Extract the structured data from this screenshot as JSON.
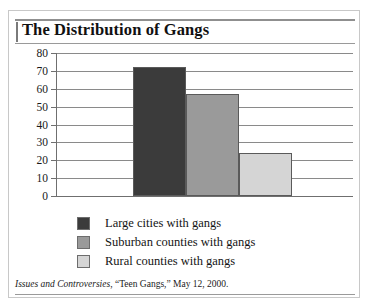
{
  "figure": {
    "title": "The Distribution of Gangs",
    "source_italic": "Issues and Controversies",
    "source_rest": ", “Teen Gangs,” May 12, 2000."
  },
  "chart_data": {
    "type": "bar",
    "title": "The Distribution of Gangs",
    "xlabel": "",
    "ylabel": "",
    "ylim": [
      0,
      80
    ],
    "ytick_values": [
      80,
      70,
      60,
      50,
      40,
      30,
      20,
      10,
      0
    ],
    "ytick_labels": [
      "80",
      "70",
      "60",
      "50",
      "40",
      "30",
      "20",
      "10",
      "0"
    ],
    "grid": true,
    "grid_axis": "y",
    "legend_position": "bottom",
    "categories": [
      "Large cities with gangs",
      "Suburban counties with gangs",
      "Rural counties with gangs"
    ],
    "values": [
      72,
      57,
      24
    ],
    "colors": [
      "#3b3b3b",
      "#9a9a9a",
      "#d5d5d5"
    ],
    "series": [
      {
        "name": "Percent of jurisdictions with gangs",
        "values": [
          72,
          57,
          24
        ]
      }
    ],
    "bars": [
      {
        "label": "Large cities with gangs",
        "value": 72,
        "color": "#3b3b3b"
      },
      {
        "label": "Suburban counties with gangs",
        "value": 57,
        "color": "#9a9a9a"
      },
      {
        "label": "Rural counties with gangs",
        "value": 24,
        "color": "#d5d5d5"
      }
    ]
  },
  "legend": {
    "items": [
      {
        "label": "Large cities with gangs",
        "color": "#3b3b3b"
      },
      {
        "label": "Suburban counties with gangs",
        "color": "#9a9a9a"
      },
      {
        "label": "Rural counties with gangs",
        "color": "#d5d5d5"
      }
    ]
  }
}
